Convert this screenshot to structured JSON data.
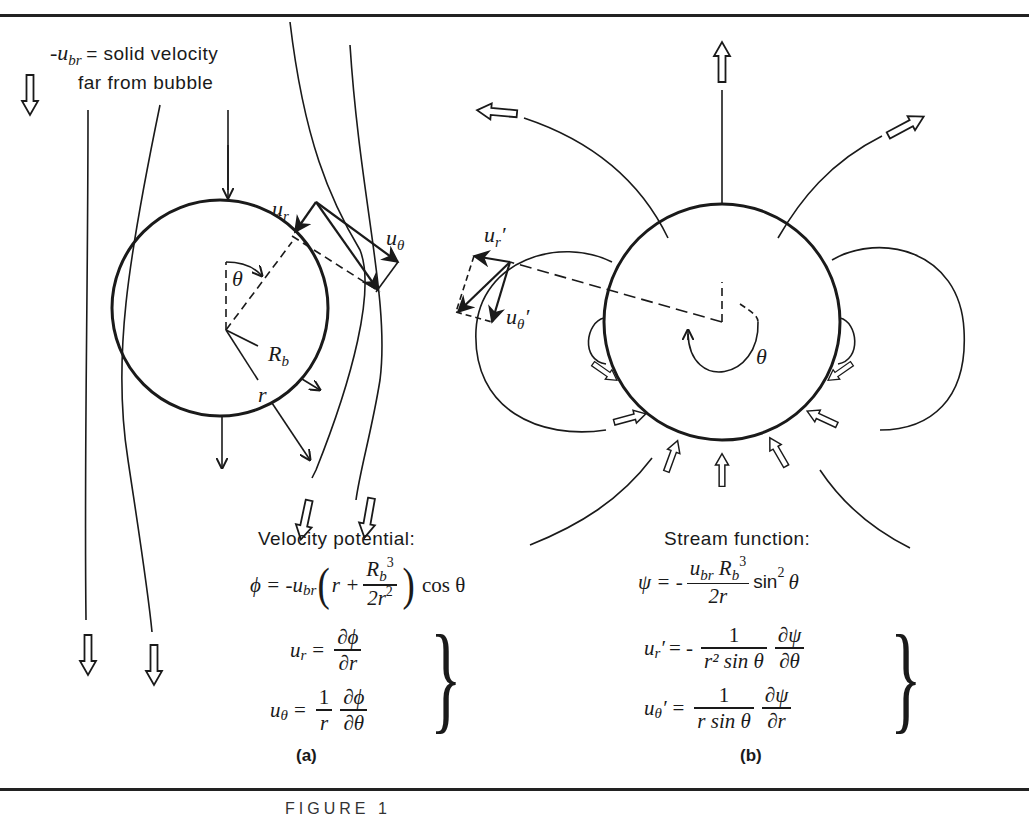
{
  "figure": {
    "caption_partial": "FIGURE 1",
    "panel_a": {
      "label": "(a)",
      "legend_symbol": "-u",
      "legend_symbol_sub": "br",
      "legend_line1": "= solid velocity",
      "legend_line2": "far from bubble",
      "labels": {
        "u_r": "u",
        "u_r_sub": "r",
        "u_theta": "u",
        "u_theta_sub": "θ",
        "theta": "θ",
        "Rb": "R",
        "Rb_sub": "b",
        "r": "r"
      },
      "formula_title": "Velocity potential:",
      "potential": {
        "lhs": "ϕ = -u",
        "lhs_sub": "br",
        "open": "(",
        "r_plus": "r +",
        "num": "R",
        "num_sub": "b",
        "num_sup": "3",
        "den": "2r",
        "den_sup": "2",
        "close": ")",
        "tail": "cos θ"
      },
      "ur_eq": {
        "lhs": "u",
        "lhs_sub": "r",
        "eq": "=",
        "num": "∂ϕ",
        "den": "∂r"
      },
      "utheta_eq": {
        "lhs": "u",
        "lhs_sub": "θ",
        "eq": "=",
        "num1": "1",
        "den1": "r",
        "num2": "∂ϕ",
        "den2": "∂θ"
      },
      "brace": "}"
    },
    "panel_b": {
      "label": "(b)",
      "labels": {
        "u_r_prime": "u",
        "u_r_prime_sub": "r",
        "u_r_prime_mark": "′",
        "u_theta_prime": "u",
        "u_theta_prime_sub": "θ",
        "u_theta_prime_mark": "′",
        "theta": "θ"
      },
      "formula_title": "Stream function:",
      "stream": {
        "lhs": "ψ = -",
        "num_u": "u",
        "num_u_sub": "br",
        "num_R": "R",
        "num_R_sub": "b",
        "num_R_sup": "3",
        "den": "2r",
        "tail": "sin",
        "tail_sup": "2",
        "tail_end": "θ"
      },
      "ur_eq": {
        "lhs": "u",
        "lhs_sub": "r",
        "lhs_mark": "′",
        "eq": "= -",
        "num1": "1",
        "den1": "r² sin θ",
        "num2": "∂ψ",
        "den2": "∂θ"
      },
      "utheta_eq": {
        "lhs": "u",
        "lhs_sub": "θ",
        "lhs_mark": "′",
        "eq": "=",
        "num1": "1",
        "den1": "r sin θ",
        "num2": "∂ψ",
        "den2": "∂r"
      },
      "brace": "}"
    },
    "colors": {
      "ink": "#1a1a1a",
      "paper": "#ffffff"
    }
  }
}
